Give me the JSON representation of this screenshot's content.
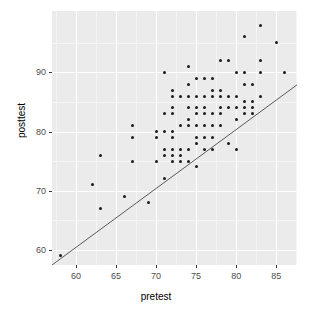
{
  "chart_data": {
    "type": "scatter",
    "title": "",
    "xlabel": "pretest",
    "ylabel": "posttest",
    "xlim": [
      57.0,
      87.6
    ],
    "ylim": [
      57.4,
      100.4
    ],
    "xticks": [
      60,
      65,
      70,
      75,
      80,
      85
    ],
    "yticks": [
      60,
      70,
      80,
      90
    ],
    "grid": true,
    "legend": null,
    "background": "#ebebeb",
    "point_color": "#1a1a1a",
    "line_color": "#595959",
    "annotations": [
      {
        "name": "reference-line",
        "type": "line",
        "description": "straight diagonal reference line",
        "x": [
          57.0,
          87.6
        ],
        "y": [
          57.4,
          87.9
        ]
      }
    ],
    "series": [
      {
        "name": "students",
        "points": [
          [
            58,
            59
          ],
          [
            62,
            71
          ],
          [
            63,
            76
          ],
          [
            63,
            67
          ],
          [
            66,
            69
          ],
          [
            67,
            81
          ],
          [
            67,
            79
          ],
          [
            67,
            75
          ],
          [
            69,
            68
          ],
          [
            70,
            80
          ],
          [
            70,
            79
          ],
          [
            70,
            75
          ],
          [
            71,
            90
          ],
          [
            71,
            83
          ],
          [
            71,
            80
          ],
          [
            71,
            77
          ],
          [
            71,
            76
          ],
          [
            71,
            72
          ],
          [
            72,
            87
          ],
          [
            72,
            86
          ],
          [
            72,
            84
          ],
          [
            72,
            83
          ],
          [
            72,
            80
          ],
          [
            72,
            79
          ],
          [
            72,
            77
          ],
          [
            72,
            76
          ],
          [
            72,
            75
          ],
          [
            73,
            86
          ],
          [
            73,
            81
          ],
          [
            73,
            77
          ],
          [
            73,
            76
          ],
          [
            73,
            75
          ],
          [
            74,
            91
          ],
          [
            74,
            88
          ],
          [
            74,
            86
          ],
          [
            74,
            84
          ],
          [
            74,
            82
          ],
          [
            74,
            81
          ],
          [
            74,
            77
          ],
          [
            74,
            75
          ],
          [
            75,
            89
          ],
          [
            75,
            86
          ],
          [
            75,
            84
          ],
          [
            75,
            83
          ],
          [
            75,
            81
          ],
          [
            75,
            79
          ],
          [
            75,
            78
          ],
          [
            75,
            74
          ],
          [
            76,
            89
          ],
          [
            76,
            86
          ],
          [
            76,
            84
          ],
          [
            76,
            83
          ],
          [
            76,
            81
          ],
          [
            76,
            79
          ],
          [
            76,
            77
          ],
          [
            77,
            89
          ],
          [
            77,
            87
          ],
          [
            77,
            86
          ],
          [
            77,
            83
          ],
          [
            77,
            81
          ],
          [
            77,
            79
          ],
          [
            77,
            77
          ],
          [
            78,
            92
          ],
          [
            78,
            87
          ],
          [
            78,
            86
          ],
          [
            78,
            84
          ],
          [
            78,
            83
          ],
          [
            78,
            81
          ],
          [
            79,
            92
          ],
          [
            79,
            86
          ],
          [
            79,
            84
          ],
          [
            79,
            78
          ],
          [
            80,
            90
          ],
          [
            80,
            86
          ],
          [
            80,
            84
          ],
          [
            80,
            82
          ],
          [
            80,
            77
          ],
          [
            81,
            96
          ],
          [
            81,
            90
          ],
          [
            81,
            88
          ],
          [
            81,
            85
          ],
          [
            81,
            84
          ],
          [
            81,
            83
          ],
          [
            82,
            88
          ],
          [
            82,
            85
          ],
          [
            82,
            84
          ],
          [
            82,
            83
          ],
          [
            83,
            98
          ],
          [
            83,
            92
          ],
          [
            83,
            90
          ],
          [
            83,
            86
          ],
          [
            85,
            95
          ],
          [
            86,
            90
          ]
        ]
      }
    ]
  },
  "axes": {
    "x_title": "pretest",
    "y_title": "posttest",
    "x_tick_labels": [
      "60",
      "65",
      "70",
      "75",
      "80",
      "85"
    ],
    "y_tick_labels": [
      "60",
      "70",
      "80",
      "90"
    ]
  }
}
